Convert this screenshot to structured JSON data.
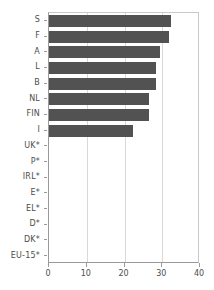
{
  "chart_data": {
    "type": "bar",
    "orientation": "horizontal",
    "title": "",
    "xlabel": "",
    "ylabel": "",
    "xlim": [
      0,
      40
    ],
    "xticks": [
      0,
      10,
      20,
      30,
      40
    ],
    "xtick_labels": [
      "0",
      "10",
      "20",
      "30",
      "40"
    ],
    "grid": true,
    "grid_axis": "x",
    "legend": false,
    "bar_color": "#525252",
    "grid_color": "#d8d8d8",
    "axis_color": "#9a9a9a",
    "text_color": "#4d4d4d",
    "categories": [
      "S",
      "F",
      "A",
      "L",
      "B",
      "NL",
      "FIN",
      "I",
      "UK*",
      "P*",
      "IRL*",
      "E*",
      "EL*",
      "D*",
      "DK*",
      "EU-15*"
    ],
    "values": [
      32.3,
      31.8,
      29.3,
      28.3,
      28.3,
      26.5,
      26.5,
      22.3,
      null,
      null,
      null,
      null,
      null,
      null,
      null,
      null
    ],
    "bars": [
      {
        "label": "S",
        "value": 32.3
      },
      {
        "label": "F",
        "value": 31.8
      },
      {
        "label": "A",
        "value": 29.3
      },
      {
        "label": "L",
        "value": 28.3
      },
      {
        "label": "B",
        "value": 28.3
      },
      {
        "label": "NL",
        "value": 26.5
      },
      {
        "label": "FIN",
        "value": 26.5
      },
      {
        "label": "I",
        "value": 22.3
      },
      {
        "label": "UK*",
        "value": null
      },
      {
        "label": "P*",
        "value": null
      },
      {
        "label": "IRL*",
        "value": null
      },
      {
        "label": "E*",
        "value": null
      },
      {
        "label": "EL*",
        "value": null
      },
      {
        "label": "D*",
        "value": null
      },
      {
        "label": "DK*",
        "value": null
      },
      {
        "label": "EU-15*",
        "value": null
      }
    ]
  }
}
